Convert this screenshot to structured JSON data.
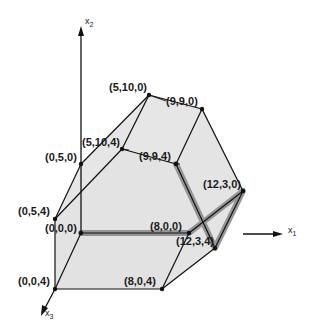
{
  "figure": {
    "title": "",
    "colors": {
      "background": "#ffffff",
      "face_fill": "#e6e6e6",
      "edge": "#111111",
      "highlight_path": "#8c8c8c",
      "axis": "#111111"
    },
    "axes": {
      "x1": {
        "label": "x",
        "sub": "1"
      },
      "x2": {
        "label": "x",
        "sub": "2"
      },
      "x3": {
        "label": "x",
        "sub": "3"
      }
    },
    "vertices": [
      {
        "id": "v000",
        "label": "(0,0,0)"
      },
      {
        "id": "v800",
        "label": "(8,0,0)"
      },
      {
        "id": "v004",
        "label": "(0,0,4)"
      },
      {
        "id": "v804",
        "label": "(8,0,4)"
      },
      {
        "id": "v050",
        "label": "(0,5,0)"
      },
      {
        "id": "v054",
        "label": "(0,5,4)"
      },
      {
        "id": "v5100",
        "label": "(5,10,0)"
      },
      {
        "id": "v5104",
        "label": "(5,10,4)"
      },
      {
        "id": "v990",
        "label": "(9,9,0)"
      },
      {
        "id": "v994",
        "label": "(9,9,4)"
      },
      {
        "id": "v1230",
        "label": "(12,3,0)"
      },
      {
        "id": "v1234",
        "label": "(12,3,4)"
      }
    ],
    "highlighted_path": [
      "(0,0,0)",
      "(8,0,0)",
      "(12,3,0)",
      "(12,3,4)",
      "(9,9,4)"
    ]
  }
}
